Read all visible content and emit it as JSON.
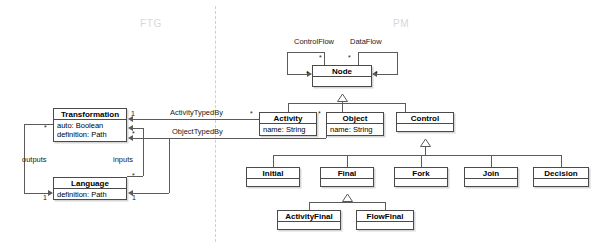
{
  "diagram": {
    "zones": [
      {
        "id": "ftg",
        "label": "FTG",
        "x": 140,
        "y": 18
      },
      {
        "id": "pm",
        "label": "PM",
        "x": 393,
        "y": 18
      }
    ],
    "divider": {
      "x": 215,
      "y_top": 6,
      "y_bottom": 242,
      "style": "dashed",
      "color": "#cfcfcf"
    },
    "classes": [
      {
        "id": "transformation",
        "name": "Transformation",
        "attributes": [
          "auto: Boolean",
          "definition: Path"
        ],
        "x": 53,
        "y": 108,
        "w": 74,
        "h": 34
      },
      {
        "id": "language",
        "name": "Language",
        "attributes": [
          "definition: Path"
        ],
        "x": 53,
        "y": 177,
        "w": 74,
        "h": 23
      },
      {
        "id": "node",
        "name": "Node",
        "attributes": [],
        "x": 312,
        "y": 65,
        "w": 60,
        "h": 22
      },
      {
        "id": "activity",
        "name": "Activity",
        "attributes": [
          "name: String"
        ],
        "x": 259,
        "y": 112,
        "w": 58,
        "h": 24
      },
      {
        "id": "object",
        "name": "Object",
        "attributes": [
          "name: String"
        ],
        "x": 326,
        "y": 112,
        "w": 58,
        "h": 24
      },
      {
        "id": "control",
        "name": "Control",
        "attributes": [],
        "x": 396,
        "y": 112,
        "w": 58,
        "h": 20
      },
      {
        "id": "initial",
        "name": "Initial",
        "attributes": [],
        "x": 246,
        "y": 167,
        "w": 54,
        "h": 20
      },
      {
        "id": "final",
        "name": "Final",
        "attributes": [],
        "x": 320,
        "y": 167,
        "w": 54,
        "h": 20
      },
      {
        "id": "fork",
        "name": "Fork",
        "attributes": [],
        "x": 394,
        "y": 167,
        "w": 54,
        "h": 20
      },
      {
        "id": "join",
        "name": "Join",
        "attributes": [],
        "x": 464,
        "y": 167,
        "w": 54,
        "h": 20
      },
      {
        "id": "decision",
        "name": "Decision",
        "attributes": [],
        "x": 533,
        "y": 167,
        "w": 56,
        "h": 20
      },
      {
        "id": "activityfinal",
        "name": "ActivityFinal",
        "attributes": [],
        "x": 277,
        "y": 210,
        "w": 64,
        "h": 20
      },
      {
        "id": "flowfinal",
        "name": "FlowFinal",
        "attributes": [],
        "x": 356,
        "y": 210,
        "w": 58,
        "h": 20
      }
    ],
    "associations": [
      {
        "id": "control-flow",
        "label": "ControlFlow",
        "source": "node",
        "target": "node",
        "x": 294,
        "y": 41
      },
      {
        "id": "data-flow",
        "label": "DataFlow",
        "source": "node",
        "target": "node",
        "x": 350,
        "y": 41
      },
      {
        "id": "activity-typed-by",
        "label": "ActivityTypedBy",
        "source": "activity",
        "target": "transformation",
        "x": 170,
        "y": 112
      },
      {
        "id": "object-typed-by",
        "label": "ObjectTypedBy",
        "source": "object",
        "target": "language",
        "x": 172,
        "y": 128
      },
      {
        "id": "outputs",
        "label": "outputs",
        "source": "transformation",
        "target": "language",
        "x": 22,
        "y": 159
      },
      {
        "id": "inputs",
        "label": "inputs",
        "source": "language",
        "target": "transformation",
        "x": 113,
        "y": 159
      }
    ],
    "multiplicities": [
      {
        "id": "m-controlflow-star-1",
        "value": "*",
        "x": 319,
        "y": 54
      },
      {
        "id": "m-dataflow-star-1",
        "value": "*",
        "x": 348,
        "y": 54
      },
      {
        "id": "m-controlflow-star-2",
        "value": "*",
        "x": 306,
        "y": 72
      },
      {
        "id": "m-dataflow-star-2",
        "value": "*",
        "x": 375,
        "y": 72
      },
      {
        "id": "m-activity-star",
        "value": "*",
        "x": 250,
        "y": 110
      },
      {
        "id": "m-object-star",
        "value": "*",
        "x": 318,
        "y": 110
      },
      {
        "id": "m-transf-1",
        "value": "1",
        "x": 131,
        "y": 112
      },
      {
        "id": "m-transf-star",
        "value": "*",
        "x": 132,
        "y": 132
      },
      {
        "id": "m-transf-out-star",
        "value": "*",
        "x": 44,
        "y": 126
      },
      {
        "id": "m-lang-out-1",
        "value": "1",
        "x": 43,
        "y": 194
      },
      {
        "id": "m-lang-in-star",
        "value": "*",
        "x": 132,
        "y": 176
      },
      {
        "id": "m-lang-in-1",
        "value": "1",
        "x": 132,
        "y": 194
      }
    ],
    "generalizations": [
      {
        "id": "gen-activity-node",
        "child": "activity",
        "parent": "node"
      },
      {
        "id": "gen-object-node",
        "child": "object",
        "parent": "node"
      },
      {
        "id": "gen-control-node",
        "child": "control",
        "parent": "node"
      },
      {
        "id": "gen-initial-control",
        "child": "initial",
        "parent": "control"
      },
      {
        "id": "gen-final-control",
        "child": "final",
        "parent": "control"
      },
      {
        "id": "gen-fork-control",
        "child": "fork",
        "parent": "control"
      },
      {
        "id": "gen-join-control",
        "child": "join",
        "parent": "control"
      },
      {
        "id": "gen-decision-control",
        "child": "decision",
        "parent": "control"
      },
      {
        "id": "gen-activityfinal-final",
        "child": "activityfinal",
        "parent": "final"
      },
      {
        "id": "gen-flowfinal-final",
        "child": "flowfinal",
        "parent": "final"
      }
    ],
    "colors": {
      "box_border": "#4a4a4a",
      "box_fill": "#ffffff",
      "line": "#5b5b5b",
      "zone_label": "#d8d8d8",
      "divider": "#cfcfcf",
      "text": "#000000"
    }
  }
}
